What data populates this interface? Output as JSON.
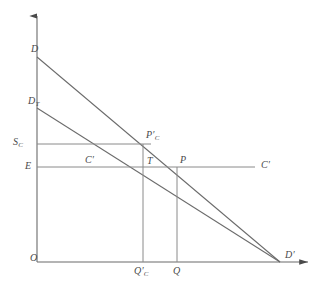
{
  "figure": {
    "type": "economics-line-diagram",
    "background_color": "#ffffff",
    "line_color": "#6b6b6b",
    "label_color": "#4a4a4a"
  },
  "axes": {
    "origin_label": "O",
    "y_axis": {
      "x": 37,
      "y_top": 14,
      "y_bottom": 262,
      "arrow": "up"
    },
    "x_axis": {
      "y": 262,
      "x_left": 37,
      "x_right": 312,
      "arrow": "right"
    }
  },
  "labels": {
    "origin": "O",
    "demand_curve": "D",
    "demand_curve_tariff_base": "D",
    "demand_curve_tariff_sub": "T",
    "supply_cost": "S",
    "supply_cost_sub": "C",
    "expenditure": "E",
    "cost_line_left": "C′",
    "cost_line_right": "C′",
    "point_pc_base": "P′",
    "point_pc_sub": "C",
    "point_t": "T",
    "point_p": "P",
    "quantity_qc_base": "Q′",
    "quantity_qc_sub": "C",
    "quantity_q": "Q",
    "demand_end": "D′"
  },
  "geometry": {
    "demand_line": {
      "x1": 37,
      "y1": 57,
      "x2": 280,
      "y2": 262
    },
    "demand_tariff_line": {
      "x1": 37,
      "y1": 108,
      "x2": 280,
      "y2": 262
    },
    "sc_horizontal": {
      "x1": 37,
      "y1": 144,
      "x2": 155,
      "y2": 144
    },
    "e_horizontal": {
      "x1": 37,
      "y1": 167,
      "x2": 255,
      "y2": 167
    },
    "qc_vertical": {
      "x": 143,
      "y_top": 144,
      "y_bottom": 262
    },
    "q_vertical": {
      "x": 177,
      "y_top": 167,
      "y_bottom": 262
    },
    "left_box_vertical": {
      "x": 37,
      "y_top": 144,
      "y_bottom": 262
    },
    "point_pc": {
      "x": 143,
      "y": 144
    },
    "point_t": {
      "x": 143,
      "y": 167
    },
    "point_p": {
      "x": 177,
      "y": 167
    },
    "point_d_prime": {
      "x": 280,
      "y": 262
    }
  }
}
